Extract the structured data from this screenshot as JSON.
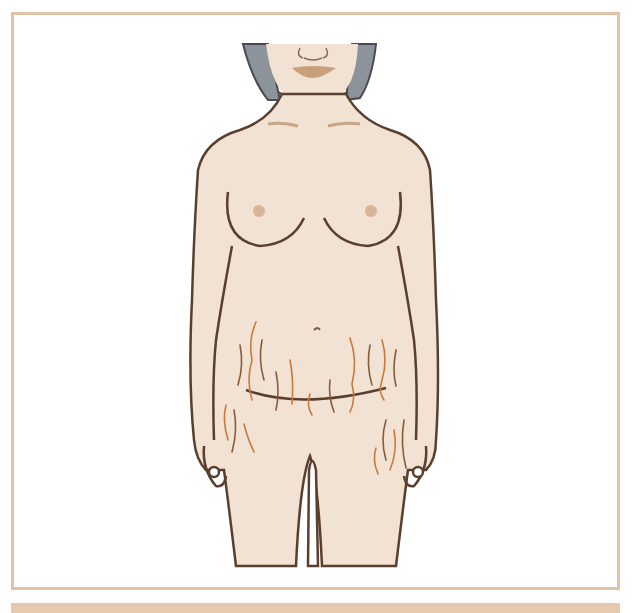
{
  "figure": {
    "colors": {
      "frame": "#e2c3a6",
      "caption_band": "#e7c9ad",
      "skin": "#f1e2d4",
      "outline": "#5a3e2e",
      "hair": "#8d939a",
      "lips": "#c9a07a",
      "areola": "#d8b49a",
      "clavicle": "#c7a585",
      "striae": "#c87a3a",
      "striae_dark": "#8a5a3a"
    }
  }
}
